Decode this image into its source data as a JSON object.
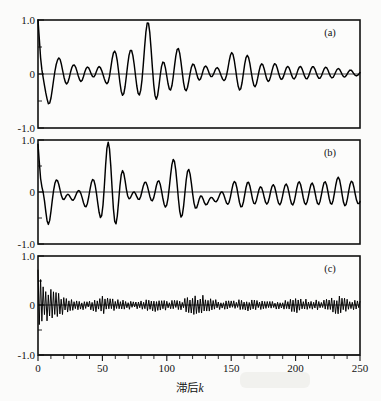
{
  "figure": {
    "background_color": "#fbfbfa",
    "ink_color": "#000000",
    "x_axis_title_cjk": "滞后",
    "x_axis_title_var": "k",
    "x_axis_title_full": "滞后k"
  },
  "chart_data": [
    {
      "type": "line",
      "title": "",
      "panel_label": "(a)",
      "xlabel": "滞后k",
      "ylabel": "",
      "xlim": [
        0,
        250
      ],
      "ylim": [
        -1.0,
        1.0
      ],
      "xticks": [
        0,
        50,
        100,
        150,
        200,
        250
      ],
      "xtick_labels": [
        "0",
        "50",
        "100",
        "150",
        "200",
        "250"
      ],
      "yticks": [
        -1.0,
        0,
        1.0
      ],
      "ytick_labels": [
        "-1.0",
        "0",
        "1.0"
      ],
      "minor_xtick_step": 10,
      "grid": false,
      "legend": false,
      "description": "Slowly damped quasi-periodic autocorrelation function, period about 11 lags, amplitude decaying from 1.0 at lag 0 to about 0.1 by lag 250",
      "x": [
        0,
        2,
        4,
        6,
        8,
        10,
        12,
        14,
        16,
        18,
        20,
        22,
        24,
        26,
        28,
        30,
        32,
        34,
        36,
        38,
        40,
        42,
        44,
        46,
        48,
        50,
        52,
        54,
        56,
        58,
        60,
        62,
        64,
        66,
        68,
        70,
        72,
        74,
        76,
        78,
        80,
        82,
        84,
        86,
        88,
        90,
        92,
        94,
        96,
        98,
        100,
        102,
        104,
        106,
        108,
        110,
        112,
        114,
        116,
        118,
        120,
        122,
        124,
        126,
        128,
        130,
        132,
        134,
        136,
        138,
        140,
        142,
        144,
        146,
        148,
        150,
        152,
        154,
        156,
        158,
        160,
        162,
        164,
        166,
        168,
        170,
        172,
        174,
        176,
        178,
        180,
        182,
        184,
        186,
        188,
        190,
        192,
        194,
        196,
        198,
        200,
        202,
        204,
        206,
        208,
        210,
        212,
        214,
        216,
        218,
        220,
        222,
        224,
        226,
        228,
        230,
        232,
        234,
        236,
        238,
        240,
        242,
        244,
        246,
        248,
        250
      ],
      "values": [
        1.0,
        0.3,
        -0.35,
        -0.55,
        -0.2,
        0.25,
        0.37,
        0.1,
        -0.22,
        -0.25,
        -0.05,
        0.13,
        0.16,
        0.03,
        -0.12,
        -0.15,
        0.0,
        0.12,
        0.1,
        -0.05,
        -0.18,
        -0.2,
        0.05,
        0.3,
        0.3,
        0.0,
        -0.3,
        -0.43,
        -0.15,
        0.25,
        0.45,
        0.2,
        -0.2,
        -0.45,
        -0.3,
        0.15,
        0.55,
        0.82,
        0.45,
        -0.15,
        -0.48,
        -0.4,
        0.0,
        0.38,
        0.42,
        0.1,
        -0.25,
        -0.27,
        -0.05,
        0.15,
        0.17,
        0.02,
        -0.12,
        -0.1,
        0.02,
        0.12,
        0.1,
        -0.05,
        -0.2,
        -0.25,
        -0.05,
        0.25,
        0.42,
        0.2,
        -0.2,
        -0.45,
        -0.3,
        0.1,
        0.35,
        0.32,
        0.0,
        -0.3,
        -0.42,
        -0.15,
        0.28,
        0.5,
        0.28,
        -0.15,
        -0.4,
        -0.3,
        0.0,
        0.2,
        0.22,
        0.03,
        -0.15,
        -0.16,
        -0.02,
        0.1,
        0.1,
        0.0,
        -0.08,
        -0.1,
        0.0,
        0.12,
        0.17,
        0.05,
        -0.12,
        -0.2,
        -0.1,
        0.12,
        0.25,
        0.15,
        -0.08,
        -0.2,
        -0.15,
        0.05,
        0.2,
        0.18,
        0.0,
        -0.15,
        -0.18,
        -0.03,
        0.12,
        0.15,
        0.03,
        -0.1,
        -0.13,
        -0.02,
        0.1,
        0.14,
        0.05,
        -0.07,
        -0.12,
        -0.05,
        0.08,
        0.12,
        0.05
      ]
    },
    {
      "type": "line",
      "title": "",
      "panel_label": "(b)",
      "xlabel": "滞后k",
      "ylabel": "",
      "xlim": [
        0,
        250
      ],
      "ylim": [
        -1.0,
        1.0
      ],
      "xticks": [
        0,
        50,
        100,
        150,
        200,
        250
      ],
      "xtick_labels": [
        "0",
        "50",
        "100",
        "150",
        "200",
        "250"
      ],
      "yticks": [
        -1.0,
        0,
        1.0
      ],
      "ytick_labels": [
        "-1.0",
        "0",
        "1.0"
      ],
      "minor_xtick_step": 10,
      "grid": false,
      "legend": false,
      "description": "Similar quasi-periodic autocorrelation with irregular bursts, peak near 0.85 at lag 52 and near 0.65 at lag 112, not visibly damped by lag 250",
      "x": [
        0,
        2,
        4,
        6,
        8,
        10,
        12,
        14,
        16,
        18,
        20,
        22,
        24,
        26,
        28,
        30,
        32,
        34,
        36,
        38,
        40,
        42,
        44,
        46,
        48,
        50,
        52,
        54,
        56,
        58,
        60,
        62,
        64,
        66,
        68,
        70,
        72,
        74,
        76,
        78,
        80,
        82,
        84,
        86,
        88,
        90,
        92,
        94,
        96,
        98,
        100,
        102,
        104,
        106,
        108,
        110,
        112,
        114,
        116,
        118,
        120,
        122,
        124,
        126,
        128,
        130,
        132,
        134,
        136,
        138,
        140,
        142,
        144,
        146,
        148,
        150,
        152,
        154,
        156,
        158,
        160,
        162,
        164,
        166,
        168,
        170,
        172,
        174,
        176,
        178,
        180,
        182,
        184,
        186,
        188,
        190,
        192,
        194,
        196,
        198,
        200,
        202,
        204,
        206,
        208,
        210,
        212,
        214,
        216,
        218,
        220,
        222,
        224,
        226,
        228,
        230,
        232,
        234,
        236,
        238,
        240,
        242,
        244,
        246,
        248,
        250
      ],
      "values": [
        0.92,
        0.15,
        -0.45,
        -0.63,
        -0.3,
        0.15,
        0.3,
        0.12,
        -0.13,
        -0.17,
        -0.13,
        -0.07,
        -0.12,
        -0.16,
        -0.1,
        0.05,
        0.12,
        -0.02,
        -0.2,
        -0.28,
        -0.08,
        0.18,
        0.33,
        0.12,
        -0.2,
        -0.58,
        -0.18,
        0.45,
        0.85,
        0.4,
        -0.25,
        -0.6,
        -0.35,
        0.05,
        0.25,
        0.2,
        -0.02,
        -0.18,
        -0.2,
        -0.1,
        0.05,
        0.18,
        0.25,
        0.1,
        -0.12,
        -0.2,
        -0.1,
        0.1,
        0.25,
        0.2,
        0.0,
        -0.25,
        -0.52,
        -0.2,
        0.25,
        0.6,
        0.65,
        0.2,
        -0.3,
        -0.55,
        -0.3,
        0.05,
        0.28,
        0.3,
        0.08,
        -0.17,
        -0.18,
        -0.14,
        -0.15,
        -0.14,
        -0.12,
        -0.05,
        0.1,
        0.2,
        0.1,
        -0.1,
        -0.2,
        -0.13,
        0.0,
        0.15,
        0.22,
        0.1,
        -0.1,
        -0.3,
        -0.33,
        -0.12,
        0.2,
        0.5,
        0.55,
        0.2,
        -0.25,
        -0.4,
        -0.35,
        -0.15,
        0.05,
        0.18,
        0.12,
        -0.05,
        -0.2,
        -0.22,
        -0.08,
        0.12,
        0.2,
        0.12,
        -0.05,
        -0.18,
        -0.18,
        -0.05,
        0.1,
        0.2,
        0.15,
        -0.05,
        -0.3,
        -0.4,
        -0.15,
        0.2,
        0.45,
        0.3,
        -0.05,
        -0.28,
        -0.2,
        0.0,
        0.15,
        0.18,
        0.05,
        -0.13
      ]
    },
    {
      "type": "line",
      "title": "",
      "panel_label": "(c)",
      "xlabel": "滞后k",
      "ylabel": "",
      "xlim": [
        0,
        250
      ],
      "ylim": [
        -1.0,
        1.0
      ],
      "xticks": [
        0,
        50,
        100,
        150,
        200,
        250
      ],
      "xtick_labels": [
        "0",
        "50",
        "100",
        "150",
        "200",
        "250"
      ],
      "yticks": [
        -1.0,
        0,
        1.0
      ],
      "ytick_labels": [
        "-1.0",
        "0",
        "1.0"
      ],
      "minor_xtick_step": 10,
      "grid": false,
      "legend": false,
      "description": "Rapidly oscillating high-frequency autocorrelation, period about 2 lags, large spike of 0.72 down to -0.4 near lag 2, amplitude envelope decaying quickly to roughly 0.08 with recurring bursts near lags 50, 90, 125, 160, 200 and 235",
      "envelope_x": [
        0,
        2,
        5,
        10,
        15,
        20,
        25,
        30,
        40,
        50,
        60,
        70,
        80,
        90,
        100,
        110,
        120,
        125,
        130,
        140,
        150,
        160,
        170,
        180,
        190,
        200,
        210,
        220,
        230,
        235,
        240,
        250
      ],
      "envelope_values": [
        0.72,
        0.5,
        0.33,
        0.25,
        0.2,
        0.14,
        0.1,
        0.08,
        0.07,
        0.16,
        0.09,
        0.07,
        0.07,
        0.12,
        0.08,
        0.08,
        0.15,
        0.19,
        0.13,
        0.08,
        0.07,
        0.1,
        0.08,
        0.06,
        0.07,
        0.13,
        0.09,
        0.08,
        0.14,
        0.16,
        0.11,
        0.07
      ]
    }
  ]
}
